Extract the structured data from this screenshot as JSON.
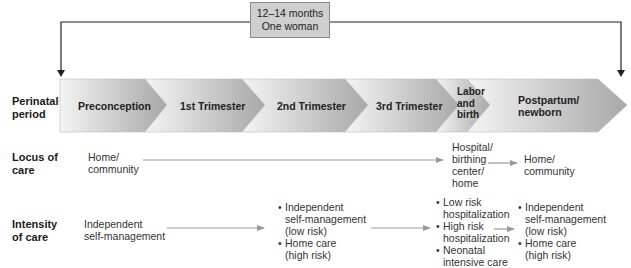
{
  "header": {
    "duration_box": {
      "line1": "12–14 months",
      "line2": "One woman"
    }
  },
  "rows": {
    "perinatal": {
      "label_line1": "Perinatal",
      "label_line2": "period"
    },
    "locus": {
      "label_line1": "Locus of",
      "label_line2": "care"
    },
    "intensity": {
      "label_line1": "Intensity",
      "label_line2": "of care"
    }
  },
  "timeline": {
    "segments": [
      {
        "label": "Preconception"
      },
      {
        "label": "1st Trimester"
      },
      {
        "label": "2nd Trimester"
      },
      {
        "label": "3rd Trimester"
      },
      {
        "label_lines": [
          "Labor",
          "and",
          "birth"
        ]
      },
      {
        "label_lines": [
          "Postpartum/",
          "newborn"
        ]
      }
    ]
  },
  "locus_of_care": {
    "stage1": {
      "lines": [
        "Home/",
        "community"
      ]
    },
    "stage2": {
      "lines": [
        "Hospital/",
        "birthing",
        "center/",
        "home"
      ]
    },
    "stage3": {
      "lines": [
        "Home/",
        "community"
      ]
    }
  },
  "intensity_of_care": {
    "stage1": {
      "lines": [
        "Independent",
        "self-management"
      ]
    },
    "stage2": {
      "bullets": [
        {
          "lines": [
            "Independent",
            "self-management",
            "(low risk)"
          ]
        },
        {
          "lines": [
            "Home care",
            "(high risk)"
          ]
        }
      ]
    },
    "stage3": {
      "bullets": [
        {
          "lines": [
            "Low risk",
            "hospitalization"
          ]
        },
        {
          "lines": [
            "High risk",
            "hospitalization"
          ]
        },
        {
          "lines": [
            "Neonatal",
            "intensive care"
          ]
        }
      ]
    },
    "stage4": {
      "bullets": [
        {
          "lines": [
            "Independent",
            "self-management",
            "(low risk)"
          ]
        },
        {
          "lines": [
            "Home care",
            "(high risk)"
          ]
        }
      ]
    }
  },
  "colors": {
    "chevron_dark": "#a9a9a9",
    "chevron_light": "#f2f2f2",
    "arrow_gray": "#9a9a9a",
    "bracket_line": "#222222",
    "duration_box_fill": "#cfcfcf"
  }
}
